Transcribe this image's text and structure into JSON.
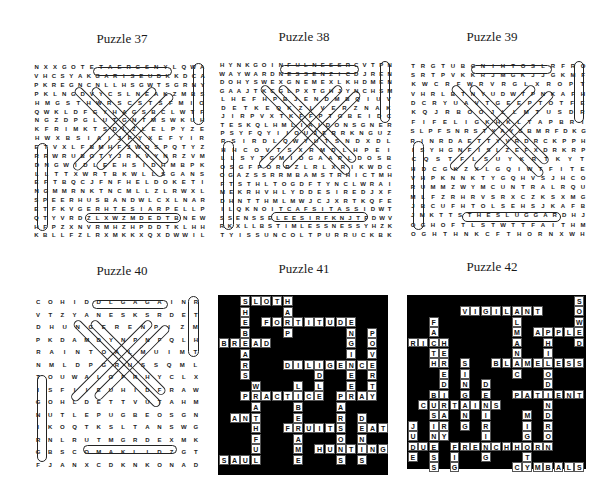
{
  "titles": [
    "Puzzle 37",
    "Puzzle 38",
    "Puzzle 39",
    "Puzzle 40",
    "Puzzle 41",
    "Puzzle 42"
  ],
  "puzzle37": {
    "title": "Puzzle 37",
    "type": "word-search",
    "rows": [
      "NXXGOTETAERGSNYLQWA",
      "VHCSYAKGARISEUDKKDCA",
      "PKREGNCNLLHSGWTSGRNY",
      "PKLNGDVYCSLNEAKZMBS",
      "HMGSTHWRSCSTSFMIO",
      "QWKLDFGYHAGSBCLWTF",
      "NGZDPGLUTGNTMSWKUH",
      "KFRIMKTSDLZLELPYZE",
      "HWXBSIAIJFYXEFYIR",
      "ETVXLFBMHFJWOSPQTYZ",
      "RRWRUBOTYJRKVYNRZVM",
      "DNGWIDLEEHSIDHMBPK",
      "LLTTXWRTBKWLLSGANS",
      "EFTBQCJFNFHELDOKETI",
      "NGMMRNKTNCMLLZLRWXL",
      "SPEERHUSBANDWLCXLNAR",
      "ETFKVGERHTESIARPELLP",
      "QTYVRDZLXWZMDEDTBNEW",
      "HFPZXNVRMHZHPDDTKLHH",
      "KBLLFZLRXMKKXQXDWWIL"
    ],
    "found_words_visible": [
      "ETTETAERG",
      "SARISEU",
      "HEINDOW",
      "LLSGANS",
      "HELDOKET",
      "HUSBAND",
      "PRAISETHER",
      "DE"
    ]
  },
  "puzzle38": {
    "title": "Puzzle 38",
    "type": "word-search",
    "rows": [
      "HYNKGOINFULNESSRCVTPN",
      "WAYWARDNESSENZICDJREN",
      "DOHYSWEXGNEMEXLKHDMEN",
      "GAAJTKCGLPXTGHJYNCHSM",
      "LHEFHPBJENDMBQIUV",
      "DETKEQKZLVERZNAK",
      "JIRPVXTKFFPTGBEIDC",
      "TESKQLHMLIAIDONSGNER",
      "PSYFQYIIOUJERRKNGUZ",
      "RSIRDLQWYUTSNDXDL",
      "HHCOVTSXRMDLHPEI",
      "LLSYTGMIOGAAPLDOSB",
      "OSGFPORRZLRLXRIKWDC",
      "OGAZSSRRMBAMSTRHICTMH",
      "FTSTHLTOGDFTYNCLWRAI",
      "MEKRHVHLYDDESIREDJXF",
      "DHNTTHMLMWJCJXRTKQFE",
      "ILQKNOITCAFSITASSIDWT",
      "SSENSSELEESIRFKNJTFDWV",
      "RKXLLBSTIMLESSNESSYHZK",
      "TYISSUNCOLTPURRUCKBK"
    ],
    "found_words_visible": [
      "INFULNESS",
      "WAYWARDNESS",
      "DESIRE",
      "DISSATISFACTION",
      "SSELEES",
      "TIMLESSNESS",
      "ISSU",
      "OLTPURRU"
    ]
  },
  "puzzle39": {
    "title": "Puzzle 39",
    "type": "word-search",
    "rows": [
      "TRGTUBGNIHTOSLRFRO",
      "SRTPVKKRJMGKJJGKMF",
      "KWCRFWRVRGLXROPT",
      "VHRLBTNYUDWTPNKAFH",
      "DCRYUAVTGEEPTOTFE",
      "KQJRBOOJLLMTUSDR",
      "FIFELIGKHKLTAPBRI",
      "SLPFSNRSTYAYSBMRFDKG",
      "RINRDAETTYVRDRCKPPH",
      "ISYHGNFISLZEFXDRKRP",
      "CQSTFLSUYKRTKYT",
      "HDCGKZXLGQIWTFITE",
      "VHPKNNKTYGQHVSJHCO",
      "RUMMZWYMCUNTRALRQU",
      "MLFZRHRVSRXCZKSXMG",
      "JBCUFHTOLSEHSJKAFB",
      "JMKTTSTHESLUGGARDHJ",
      "OGHOFTLSTWTTFAITHM",
      "OGHTHNKCFTHORNXWH"
    ],
    "found_words_visible": [
      "TUBGNIHTOS",
      "UFHTOLSEH",
      "THESLUGGARD",
      "FAITH",
      "FTHORN"
    ]
  },
  "puzzle40": {
    "title": "Puzzle 40",
    "type": "word-search",
    "rows": [
      "COHIDDLGAGAINR",
      "VTZYANESKSRDET",
      "DHUNGERENPIZM",
      "PKDAMDYNPNFQLH",
      "RAINTOALMUIMT",
      "NMLDPGRUSSQML",
      "TOUWALOFRHYCLX",
      "ISFIIEUHIDFRAW",
      "GOHLDETTVUTAHM",
      "NUTLEPUGBEOSGN",
      "IKOQTKSLTANSWG",
      "RNLRUTMGRDEXMK",
      "GBSCOMAKLIDZGT",
      "FJANXCDKNKONAD"
    ],
    "found_words_visible": [
      "COHI",
      "AGAIN",
      "HUNGER",
      "RAINTOA",
      "LID",
      "ONA"
    ]
  },
  "puzzle41": {
    "title": "Puzzle 41",
    "type": "crossword-fill-in",
    "cell_size": 10.6,
    "words": [
      {
        "word": "SLOTH",
        "col": 2,
        "row": 0,
        "dir": "across"
      },
      {
        "word": "SHEBEARS",
        "col": 2,
        "row": 0,
        "dir": "down"
      },
      {
        "word": "HARP",
        "col": 6,
        "row": 0,
        "dir": "down"
      },
      {
        "word": "FORTITUDE",
        "col": 4,
        "row": 2,
        "dir": "across"
      },
      {
        "word": "ENGINEER",
        "col": 12,
        "row": 2,
        "dir": "down"
      },
      {
        "word": "POVERTY",
        "col": 14,
        "row": 3,
        "dir": "down"
      },
      {
        "word": "BREAD",
        "col": 0,
        "row": 4,
        "dir": "across"
      },
      {
        "word": "DILIGENCE",
        "col": 6,
        "row": 6,
        "dir": "across"
      },
      {
        "word": "IDLE",
        "col": 9,
        "row": 6,
        "dir": "down"
      },
      {
        "word": "WRATHFUL",
        "col": 3,
        "row": 8,
        "dir": "down"
      },
      {
        "word": "LIBERAME",
        "col": 7,
        "row": 8,
        "dir": "down"
      },
      {
        "word": "PRACTICE",
        "col": 2,
        "row": 9,
        "dir": "across"
      },
      {
        "word": "PRAY",
        "col": 11,
        "row": 9,
        "dir": "across"
      },
      {
        "word": "PARSONS",
        "col": 11,
        "row": 9,
        "dir": "down"
      },
      {
        "word": "ANT",
        "col": 1,
        "row": 11,
        "dir": "across"
      },
      {
        "word": "DENIS",
        "col": 13,
        "row": 11,
        "dir": "down"
      },
      {
        "word": "FRUITS",
        "col": 6,
        "row": 12,
        "dir": "across"
      },
      {
        "word": "EAT",
        "col": 13,
        "row": 12,
        "dir": "across"
      },
      {
        "word": "HUNTING",
        "col": 9,
        "row": 14,
        "dir": "across"
      },
      {
        "word": "SAUL",
        "col": 0,
        "row": 15,
        "dir": "across"
      }
    ]
  },
  "puzzle42": {
    "title": "Puzzle 42",
    "type": "crossword-fill-in",
    "cell_size": 10.4,
    "words": [
      {
        "word": "SOWED",
        "col": 16,
        "row": 0,
        "dir": "down"
      },
      {
        "word": "VIGILANT",
        "col": 5,
        "row": 1,
        "dir": "across"
      },
      {
        "word": "ALMANAC",
        "col": 10,
        "row": 1,
        "dir": "down"
      },
      {
        "word": "FAITH",
        "col": 2,
        "row": 2,
        "dir": "down"
      },
      {
        "word": "APPLE",
        "col": 12,
        "row": 3,
        "dir": "across"
      },
      {
        "word": "RICH",
        "col": 0,
        "row": 4,
        "dir": "across"
      },
      {
        "word": "HEREDITARY",
        "col": 3,
        "row": 4,
        "dir": "down"
      },
      {
        "word": "PHILODENDRON",
        "col": 13,
        "row": 3,
        "dir": "down"
      },
      {
        "word": "BLAMELESS",
        "col": 8,
        "row": 6,
        "dir": "across"
      },
      {
        "word": "SINGING",
        "col": 5,
        "row": 6,
        "dir": "down"
      },
      {
        "word": "DESIRING",
        "col": 7,
        "row": 8,
        "dir": "down"
      },
      {
        "word": "PATIENT",
        "col": 10,
        "row": 9,
        "dir": "across"
      },
      {
        "word": "BUSINESS",
        "col": 2,
        "row": 9,
        "dir": "down"
      },
      {
        "word": "CURTAINS",
        "col": 1,
        "row": 10,
        "dir": "across"
      },
      {
        "word": "MIGHT",
        "col": 11,
        "row": 11,
        "dir": "down"
      },
      {
        "word": "JUDE",
        "col": 0,
        "row": 12,
        "dir": "down"
      },
      {
        "word": "DUE",
        "col": 0,
        "row": 14,
        "dir": "across"
      },
      {
        "word": "FRENCHHORN",
        "col": 4,
        "row": 14,
        "dir": "across"
      },
      {
        "word": "FIG",
        "col": 4,
        "row": 14,
        "dir": "down"
      },
      {
        "word": "CYMBALS",
        "col": 10,
        "row": 16,
        "dir": "across"
      }
    ]
  }
}
